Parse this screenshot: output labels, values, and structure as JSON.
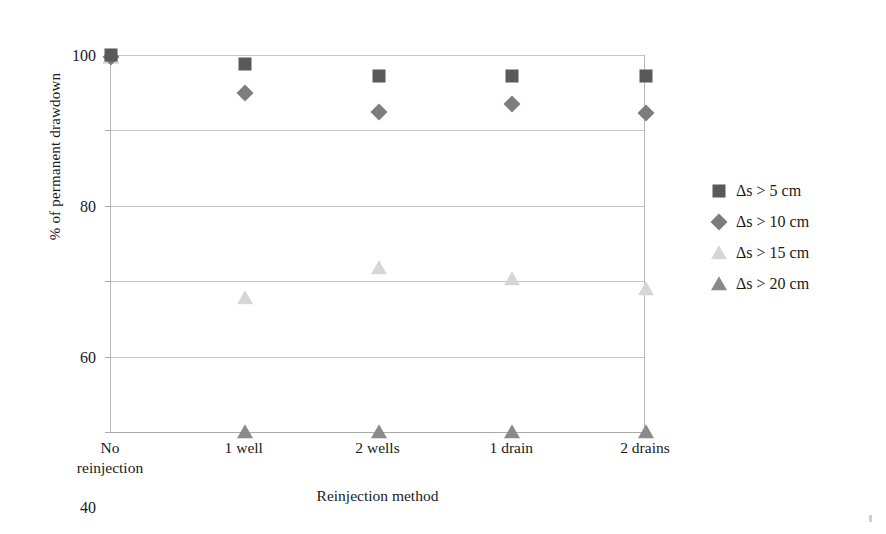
{
  "chart_data": {
    "type": "scatter",
    "title": "",
    "xlabel": "Reinjection method",
    "ylabel": "% of permanent drawdown",
    "categories": [
      "No\nreinjection",
      "1 well",
      "2 wells",
      "1 drain",
      "2 drains"
    ],
    "categories_flat": [
      "No reinjection",
      "1 well",
      "2 wells",
      "1 drain",
      "2 drains"
    ],
    "yticks": [
      0,
      20,
      40,
      60,
      80,
      100
    ],
    "ytick_labels": [
      "0",
      "20",
      "40",
      "60",
      "80",
      "100"
    ],
    "ylim": [
      0,
      100
    ],
    "grid": true,
    "legend_position": "right",
    "series": [
      {
        "name": "Δs > 5 cm",
        "marker": "square",
        "color": "#595959",
        "values": [
          100,
          97.5,
          94.5,
          94.5,
          94.5
        ]
      },
      {
        "name": "Δs > 10 cm",
        "marker": "diamond",
        "color": "#7d7d7d",
        "values": [
          99.5,
          90,
          85,
          87,
          84.5
        ]
      },
      {
        "name": "Δs > 15 cm",
        "marker": "triangle-light",
        "color": "#d6d6d6",
        "values": [
          99.5,
          35.5,
          43.5,
          40.5,
          38
        ]
      },
      {
        "name": "Δs > 20 cm",
        "marker": "triangle-dark",
        "color": "#8a8a8a",
        "values": [
          99.5,
          0,
          0,
          0,
          0
        ]
      }
    ]
  },
  "legend": {
    "items": [
      {
        "label": "Δs > 5 cm",
        "marker": "square"
      },
      {
        "label": "Δs > 10 cm",
        "marker": "diamond"
      },
      {
        "label": "Δs > 15 cm",
        "marker": "triangle-light"
      },
      {
        "label": "Δs > 20 cm",
        "marker": "triangle-dark"
      }
    ]
  },
  "colors": {
    "series_5cm": "#595959",
    "series_10cm": "#7d7d7d",
    "series_15cm": "#d6d6d6",
    "series_20cm": "#8a8a8a",
    "gridline": "#c5c5c5",
    "axis": "#a9a9a9",
    "background": "#ffffff",
    "text": "#1a1a1a"
  }
}
